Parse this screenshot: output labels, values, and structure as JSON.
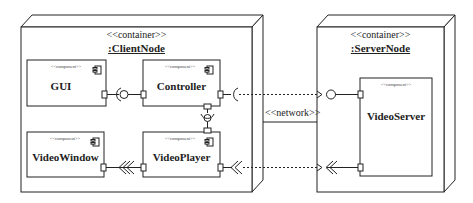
{
  "diagram": {
    "type": "UML deployment diagram",
    "nodes": [
      {
        "id": "client",
        "stereotype": "<<container>>",
        "name": ":ClientNode"
      },
      {
        "id": "server",
        "stereotype": "<<container>>",
        "name": ":ServerNode"
      }
    ],
    "components": [
      {
        "id": "gui",
        "stereotype": "<<component>>",
        "name": "GUI",
        "node": "client"
      },
      {
        "id": "controller",
        "stereotype": "<<component>>",
        "name": "Controller",
        "node": "client"
      },
      {
        "id": "videowindow",
        "stereotype": "<<component>>",
        "name": "VideoWindow",
        "node": "client"
      },
      {
        "id": "videoplayer",
        "stereotype": "<<component>>",
        "name": "VideoPlayer",
        "node": "client"
      },
      {
        "id": "videoserver",
        "stereotype": "<<component>>",
        "name": "VideoServer",
        "node": "server"
      }
    ],
    "links": [
      {
        "from": "client",
        "to": "server",
        "label": "<<network>>"
      }
    ],
    "connections": [
      {
        "from": "gui",
        "to": "controller",
        "kind": "assembly (ball-and-socket)"
      },
      {
        "from": "controller",
        "to": "videoplayer",
        "kind": "assembly (ball-and-socket)"
      },
      {
        "from": "videoplayer",
        "to": "videowindow",
        "kind": "stream (chevrons)"
      },
      {
        "from": "controller",
        "to": "videoserver",
        "kind": "dashed dependency to provided interface"
      },
      {
        "from": "videoplayer",
        "to": "videoserver",
        "kind": "dashed dependency to stream port"
      }
    ]
  }
}
